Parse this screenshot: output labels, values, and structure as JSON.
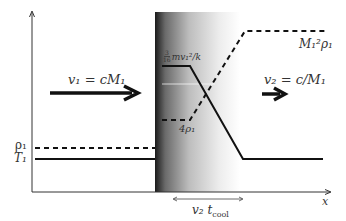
{
  "diagram": {
    "type": "shock-profile",
    "labels": {
      "v1": "v₁ = cM₁",
      "v2": "v₂ = c/M₁",
      "rho1": "ρ₁",
      "T1": "T₁",
      "post_shock_T": "3/16 mv₁²/k",
      "post_shock_rho": "4ρ₁",
      "final_rho": "M₁²ρ₁",
      "cooling_length": "v₂ t",
      "cooling_length_sub": "cool",
      "x_axis": "x"
    },
    "frac": {
      "num": "3",
      "den": "16",
      "rest": "mv₁²/k"
    },
    "curves": [
      {
        "name": "temperature",
        "style": "solid",
        "points": [
          [
            35,
            159
          ],
          [
            155,
            159
          ],
          [
            162,
            66
          ],
          [
            190,
            66
          ],
          [
            243,
            159
          ],
          [
            323,
            159
          ]
        ]
      },
      {
        "name": "density",
        "style": "dashed",
        "points": [
          [
            35,
            148
          ],
          [
            155,
            148
          ],
          [
            162,
            120
          ],
          [
            190,
            120
          ],
          [
            245,
            31
          ],
          [
            325,
            31
          ]
        ]
      }
    ],
    "colors": {
      "line": "#111111",
      "text": "#444444",
      "shock_dark": "#1a1a1a"
    }
  }
}
